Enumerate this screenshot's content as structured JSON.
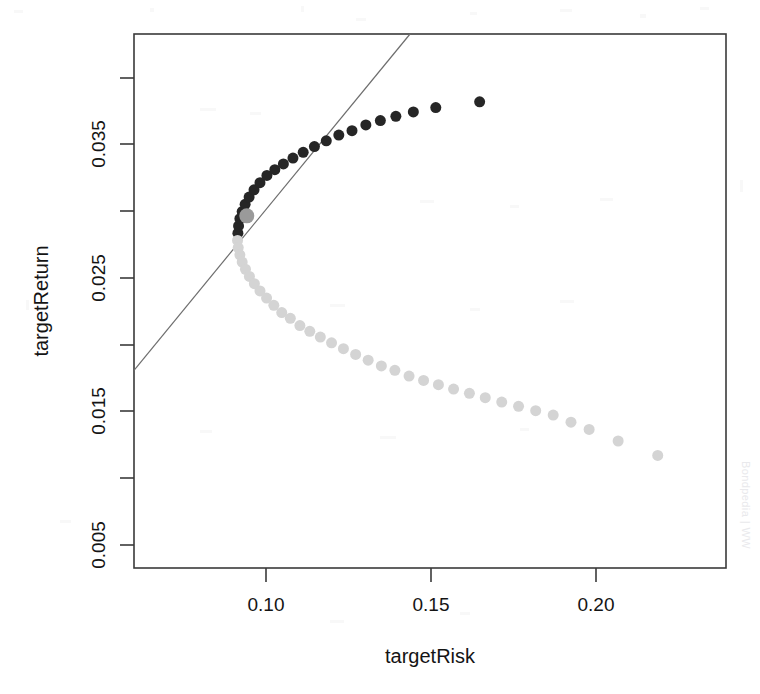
{
  "chart_data": {
    "type": "scatter",
    "title": "",
    "subtitle": "",
    "xlabel": "targetRisk",
    "ylabel": "targetReturn",
    "xlim": [
      0.063,
      0.2425
    ],
    "ylim": [
      0.003,
      0.04
    ],
    "grid": false,
    "legend": "none",
    "xticks": [
      0.1,
      0.15,
      0.2
    ],
    "xtick_labels": [
      "0.10",
      "0.15",
      "0.20"
    ],
    "yticks": [
      0.005,
      0.015,
      0.025,
      0.035
    ],
    "ytick_labels": [
      "0.005",
      "0.015",
      "0.025",
      "0.035"
    ],
    "yminor_ticks": [
      0.01,
      0.02,
      0.03,
      0.039
    ],
    "series": [
      {
        "name": "efficient-frontier-upper",
        "color": "#262626",
        "marker": "filled-circle",
        "marker_size": 11,
        "points": [
          [
            0.0945,
            0.0262
          ],
          [
            0.0947,
            0.0267
          ],
          [
            0.0951,
            0.0272
          ],
          [
            0.0958,
            0.0277
          ],
          [
            0.0967,
            0.0282
          ],
          [
            0.0979,
            0.0287
          ],
          [
            0.0994,
            0.0292
          ],
          [
            0.1012,
            0.0297
          ],
          [
            0.1033,
            0.0302
          ],
          [
            0.1057,
            0.0306
          ],
          [
            0.1083,
            0.031
          ],
          [
            0.1112,
            0.0314
          ],
          [
            0.1143,
            0.0318
          ],
          [
            0.1177,
            0.0322
          ],
          [
            0.1213,
            0.0326
          ],
          [
            0.1251,
            0.033
          ],
          [
            0.1291,
            0.0333
          ],
          [
            0.1333,
            0.0337
          ],
          [
            0.1377,
            0.034
          ],
          [
            0.1424,
            0.0343
          ],
          [
            0.1477,
            0.0346
          ],
          [
            0.1545,
            0.0349
          ],
          [
            0.1678,
            0.0353
          ]
        ]
      },
      {
        "name": "inefficient-frontier-lower",
        "color": "#d4d4d4",
        "marker": "filled-circle",
        "marker_size": 11,
        "points": [
          [
            0.0944,
            0.0257
          ],
          [
            0.0946,
            0.0252
          ],
          [
            0.0951,
            0.0247
          ],
          [
            0.0958,
            0.0242
          ],
          [
            0.0968,
            0.0237
          ],
          [
            0.098,
            0.0232
          ],
          [
            0.0995,
            0.0227
          ],
          [
            0.1012,
            0.0222
          ],
          [
            0.1032,
            0.0217
          ],
          [
            0.1054,
            0.0212
          ],
          [
            0.1078,
            0.0207
          ],
          [
            0.1104,
            0.0203
          ],
          [
            0.1133,
            0.0198
          ],
          [
            0.1163,
            0.0194
          ],
          [
            0.1195,
            0.019
          ],
          [
            0.1229,
            0.0186
          ],
          [
            0.1265,
            0.0182
          ],
          [
            0.1302,
            0.0178
          ],
          [
            0.134,
            0.0174
          ],
          [
            0.138,
            0.017
          ],
          [
            0.1421,
            0.0167
          ],
          [
            0.1464,
            0.0163
          ],
          [
            0.1508,
            0.016
          ],
          [
            0.1553,
            0.0157
          ],
          [
            0.1599,
            0.0154
          ],
          [
            0.1647,
            0.0151
          ],
          [
            0.1695,
            0.0148
          ],
          [
            0.1745,
            0.0145
          ],
          [
            0.1796,
            0.0142
          ],
          [
            0.1848,
            0.0139
          ],
          [
            0.1901,
            0.0136
          ],
          [
            0.1955,
            0.0131
          ],
          [
            0.201,
            0.0126
          ],
          [
            0.2098,
            0.0118
          ],
          [
            0.2218,
            0.0108
          ]
        ]
      },
      {
        "name": "tangency-portfolio",
        "color": "#9a9a9a",
        "marker": "filled-circle",
        "marker_size": 15,
        "points": [
          [
            0.0972,
            0.0274
          ]
        ]
      }
    ],
    "lines": [
      {
        "name": "capital-market-line",
        "color": "#6d6d6d",
        "width": 1.2,
        "from": [
          0.063,
          0.0167
        ],
        "to": [
          0.1467,
          0.04
        ]
      }
    ]
  },
  "axes": {
    "x": {
      "label": "targetRisk",
      "tick_labels": [
        "0.10",
        "0.15",
        "0.20"
      ]
    },
    "y": {
      "label": "targetReturn",
      "tick_labels": [
        "0.005",
        "0.015",
        "0.025",
        "0.035"
      ]
    }
  },
  "watermark": {
    "text": "Bondpedia | WW"
  }
}
